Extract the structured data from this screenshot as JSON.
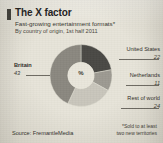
{
  "header": {
    "title": "The X factor",
    "subtitle": "Fast-growing entertainment formats*",
    "subtitle2": "By country of origin, 1st half 2011"
  },
  "footer": {
    "source": "Source: FremantleMedia",
    "footnote_line1": "*Sold to at least",
    "footnote_line2": "two new territories"
  },
  "chart_data": {
    "type": "pie",
    "variant": "donut",
    "title": "The X factor",
    "subtitle": "Fast-growing entertainment formats*",
    "note": "By country of origin, 1st half 2011",
    "unit": "%",
    "center_label": "%",
    "categories": [
      "Britain",
      "United States",
      "Netherlands",
      "Rest of world"
    ],
    "values": [
      43,
      22,
      11,
      24
    ],
    "colors": [
      "#8b8880",
      "#4a4945",
      "#9d9a92",
      "#c9c6bc"
    ],
    "legend_position": "callouts",
    "slices": [
      {
        "name": "United States",
        "value": "22",
        "color": "#4a4945"
      },
      {
        "name": "Netherlands",
        "value": "11",
        "color": "#9d9a92"
      },
      {
        "name": "Rest of world",
        "value": "24",
        "color": "#c9c6bc"
      },
      {
        "name": "Britain",
        "value": "43",
        "color": "#8b8880"
      }
    ]
  }
}
